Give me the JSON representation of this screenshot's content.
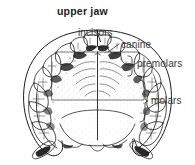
{
  "figure": {
    "title": "upper jaw",
    "background_color": "#ffffff",
    "ink_color": "#1d1d1d",
    "label_color": "#3a3a3a"
  },
  "labels": {
    "title": "upper jaw",
    "incisors": "incisors",
    "canine": "canine",
    "premolars": "premolars",
    "molars": "molars"
  },
  "annotations": [
    {
      "name": "incisors",
      "text": "incisors",
      "connector": "brace",
      "side": "top"
    },
    {
      "name": "canine",
      "text": "canine",
      "connector": "leader",
      "side": "right"
    },
    {
      "name": "premolars",
      "text": "premolars",
      "connector": "brace",
      "side": "right"
    },
    {
      "name": "molars",
      "text": "molars",
      "connector": "brace",
      "side": "right"
    }
  ]
}
